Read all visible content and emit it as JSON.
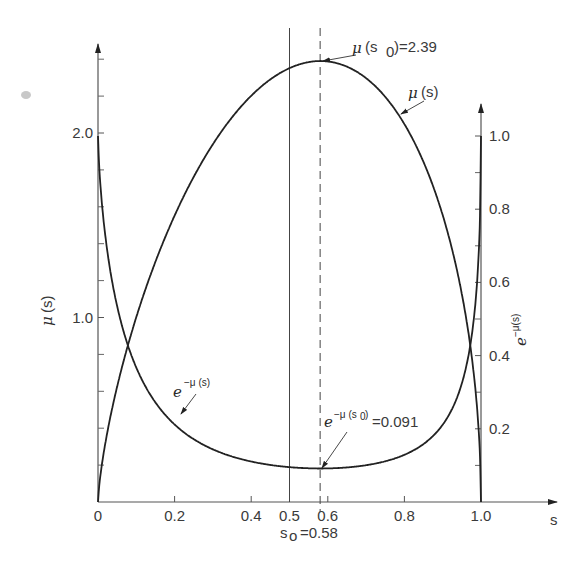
{
  "chart_data": {
    "type": "line",
    "title": "",
    "xlabel": "s",
    "ylabel_left": "μ(s)",
    "ylabel_right": "e^{-μ(s)}",
    "xlim": [
      0,
      1.0
    ],
    "ylim_left": [
      0,
      2.5
    ],
    "ylim_right": [
      0,
      1.0
    ],
    "x_ticks": [
      "0",
      "0.2",
      "0.4",
      "0.5",
      "0.6",
      "0.8",
      "1.0"
    ],
    "x_tick_values": [
      0,
      0.2,
      0.4,
      0.5,
      0.6,
      0.8,
      1.0
    ],
    "left_ticks": [
      "1.0",
      "2.0"
    ],
    "left_tick_values": [
      1.0,
      2.0
    ],
    "left_minor_ticks": [
      0.2,
      0.4,
      0.6,
      0.8,
      1.2,
      1.4,
      1.6,
      1.8,
      2.2,
      2.4
    ],
    "right_ticks": [
      "0.2",
      "0.4",
      "0.6",
      "0.8",
      "1.0"
    ],
    "right_tick_values": [
      0.2,
      0.4,
      0.6,
      0.8,
      1.0
    ],
    "right_minor_ticks": [
      0.1,
      0.3,
      0.5,
      0.7,
      0.9
    ],
    "grid": false,
    "vertical_lines": [
      {
        "x": 0.5,
        "style": "solid"
      },
      {
        "x": 0.58,
        "style": "dashed"
      }
    ],
    "series": [
      {
        "name": "μ(s)",
        "axis": "left",
        "x": [
          0,
          0.02,
          0.05,
          0.085,
          0.12,
          0.16,
          0.2,
          0.25,
          0.3,
          0.35,
          0.4,
          0.45,
          0.5,
          0.55,
          0.58,
          0.62,
          0.66,
          0.7,
          0.75,
          0.8,
          0.85,
          0.9,
          0.93,
          0.955,
          0.975,
          0.99,
          1.0
        ],
        "values": [
          0,
          0.22,
          0.52,
          0.85,
          1.12,
          1.38,
          1.6,
          1.82,
          1.99,
          2.12,
          2.22,
          2.3,
          2.35,
          2.385,
          2.39,
          2.375,
          2.33,
          2.24,
          2.07,
          1.82,
          1.47,
          1.03,
          0.73,
          0.76,
          0.44,
          0.18,
          0
        ]
      },
      {
        "name": "e^{-μ(s)}",
        "axis": "right",
        "x": [
          0,
          0.02,
          0.05,
          0.085,
          0.12,
          0.16,
          0.2,
          0.25,
          0.3,
          0.35,
          0.4,
          0.45,
          0.5,
          0.55,
          0.58,
          0.62,
          0.66,
          0.7,
          0.75,
          0.8,
          0.85,
          0.9,
          0.93,
          0.955,
          0.975,
          0.99,
          1.0
        ],
        "values": [
          1.0,
          0.8,
          0.6,
          0.43,
          0.33,
          0.25,
          0.2,
          0.162,
          0.137,
          0.12,
          0.109,
          0.1,
          0.095,
          0.092,
          0.091,
          0.093,
          0.097,
          0.106,
          0.126,
          0.162,
          0.23,
          0.357,
          0.48,
          0.47,
          0.64,
          0.84,
          1.0
        ]
      }
    ],
    "annotations": [
      {
        "text": "μ(s₀) = 2.39",
        "x": 0.58,
        "y": 2.39,
        "axis": "left"
      },
      {
        "text": "μ(s)",
        "x": 0.76,
        "y": 2.05,
        "axis": "left"
      },
      {
        "text": "e^{-μ(s)}",
        "x": 0.2,
        "y": 0.21,
        "axis": "right"
      },
      {
        "text": "e^{-μ(s₀)} = 0.091",
        "x": 0.58,
        "y": 0.091,
        "axis": "right"
      },
      {
        "text": "s₀ = 0.58",
        "x": 0.58,
        "y": 0,
        "axis": "x"
      }
    ]
  },
  "labels": {
    "x_axis": "s",
    "left_axis_mu": "μ",
    "left_axis_arg": "(s)",
    "right_axis_e": "e",
    "right_axis_sup": "−μ(s)",
    "ann_peak_mu": "μ",
    "ann_peak_rest": "(s",
    "ann_peak_sub": "0",
    "ann_peak_val": ")=2.39",
    "ann_mu_curve_mu": "μ",
    "ann_mu_curve_rest": "(s)",
    "ann_e_curve_e": "e",
    "ann_e_curve_sup": "−μ (s)",
    "ann_emin_e": "e",
    "ann_emin_sup": "−μ (s",
    "ann_emin_sub": "0",
    "ann_emin_close": ")",
    "ann_emin_val": "=0.091",
    "s0_label_s": "s",
    "s0_label_sub": "o",
    "s0_label_val": "=0.58"
  }
}
